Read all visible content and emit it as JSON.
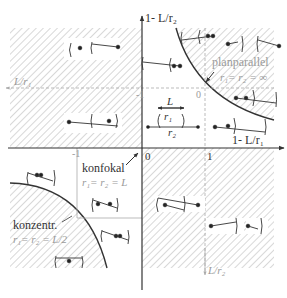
{
  "diagram": {
    "axes": {
      "x_label": "1- L/r1",
      "y_label": "1- L/r2",
      "aux_x_label": "L/r1",
      "aux_y_label": "L/r2",
      "ticks_main": {
        "origin": "0",
        "x_one": "1"
      },
      "ticks_aux": {
        "minus_one_x": "-1",
        "zero_x": "0",
        "minus_one_y": "-1",
        "minus_one_left": "-1"
      }
    },
    "annotations": {
      "planparallel": {
        "name": "planparallel",
        "condition": "r1 = r2 = ∞"
      },
      "konfokal": {
        "name": "konfokal",
        "condition": "r1 = r2 = L"
      },
      "konzentr": {
        "name": "konzentr.",
        "condition": "r1 = r2 = L/2"
      },
      "legend": {
        "L": "L",
        "r1": "r1",
        "r2": "r2"
      }
    },
    "colors": {
      "line": "#333333",
      "aux_axis": "#aaaaaa",
      "hatch": "#b5b5b5",
      "background": "#ffffff"
    }
  },
  "texts": {
    "y_axis_label_prefix": "1- ",
    "y_axis_label_var": "L",
    "y_axis_label_sub": "/r",
    "x_axis_label": "1- L/r",
    "planparallel": "planparallel",
    "planparallel_eq": "r₁= r₂ = ∞",
    "konfokal": "konfokal",
    "konfokal_eq": "r₁= r₂ = L",
    "konzentr": "konzentr.",
    "konzentr_eq": "r₁= r₂ = L/2",
    "tick_0": "0",
    "tick_1": "1",
    "aux_minus1_top": "-1",
    "aux_0_top": "0",
    "aux_minus1_left": "-1",
    "L_label": "L",
    "r1_label": "r₁",
    "r2_label": "r₂",
    "L_over_r1": "L/r₁",
    "L_over_r2": "L/r₂",
    "one_minus_L_r2": "1- L/r₂",
    "one_minus_L_r1": "1- L/r₁"
  }
}
